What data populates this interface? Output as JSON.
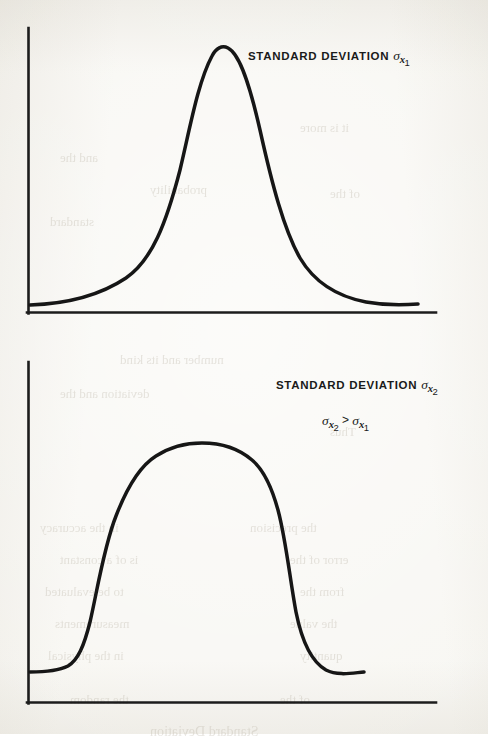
{
  "document": {
    "kind": "scanned-textbook-figure-page",
    "background_color": "#f8f7f3",
    "ink_color": "#161616"
  },
  "figures": [
    {
      "id": "figure-top",
      "label_main_prefix": "STANDARD DEVIATION ",
      "label_sigma": "σ",
      "label_subscript_var": "x",
      "label_subscript_index": "1"
    },
    {
      "id": "figure-bottom",
      "label_main_prefix": "STANDARD DEVIATION ",
      "label_sigma": "σ",
      "label_subscript_var": "x",
      "label_subscript_index": "2",
      "inequality": {
        "left_sigma": "σ",
        "left_var": "x",
        "left_index": "2",
        "operator": ">",
        "right_sigma": "σ",
        "right_var": "x",
        "right_index": "1"
      }
    }
  ],
  "bleed_through": [
    {
      "text": "it is more",
      "x": 300,
      "y": 120,
      "size": 13
    },
    {
      "text": "and the",
      "x": 60,
      "y": 150,
      "size": 13
    },
    {
      "text": "probability",
      "x": 150,
      "y": 182,
      "size": 13
    },
    {
      "text": "of the",
      "x": 330,
      "y": 186,
      "size": 13
    },
    {
      "text": "standard",
      "x": 50,
      "y": 214,
      "size": 13
    },
    {
      "text": "number and its kind",
      "x": 120,
      "y": 352,
      "size": 13
    },
    {
      "text": "deviation and the",
      "x": 60,
      "y": 386,
      "size": 13
    },
    {
      "text": "Thus",
      "x": 330,
      "y": 424,
      "size": 13
    },
    {
      "text": "in the accuracy",
      "x": 40,
      "y": 520,
      "size": 13
    },
    {
      "text": "the precision",
      "x": 250,
      "y": 520,
      "size": 13
    },
    {
      "text": "is of a constant",
      "x": 60,
      "y": 552,
      "size": 13
    },
    {
      "text": "error of the",
      "x": 290,
      "y": 552,
      "size": 13
    },
    {
      "text": "to be evaluated",
      "x": 45,
      "y": 584,
      "size": 13
    },
    {
      "text": "from the",
      "x": 300,
      "y": 584,
      "size": 13
    },
    {
      "text": "measurements",
      "x": 55,
      "y": 616,
      "size": 13
    },
    {
      "text": "the value",
      "x": 290,
      "y": 616,
      "size": 13
    },
    {
      "text": "in the physical",
      "x": 48,
      "y": 648,
      "size": 13
    },
    {
      "text": "quantity",
      "x": 300,
      "y": 648,
      "size": 13
    },
    {
      "text": "the random",
      "x": 70,
      "y": 692,
      "size": 13
    },
    {
      "text": "of the",
      "x": 280,
      "y": 692,
      "size": 13
    },
    {
      "text": "Standard Deviation",
      "x": 150,
      "y": 724,
      "size": 14
    }
  ],
  "chart_data": [
    {
      "type": "line",
      "id": "gaussian-narrow",
      "title": "STANDARD DEVIATION σx1",
      "description": "Normal (Gaussian) probability density curve with a small standard deviation — tall, narrow, sharply peaked with long flat tails.",
      "xlabel": "",
      "ylabel": "",
      "grid": false,
      "legend": false,
      "axes": {
        "x_axis": true,
        "y_axis": true,
        "ticks": false,
        "tick_labels": false
      },
      "x": [
        0,
        5,
        10,
        15,
        20,
        25,
        30,
        35,
        40,
        45,
        50,
        55,
        60,
        65,
        70,
        75,
        80,
        85,
        90,
        95,
        100
      ],
      "y": [
        0.01,
        0.015,
        0.02,
        0.03,
        0.05,
        0.08,
        0.14,
        0.24,
        0.4,
        0.62,
        0.84,
        0.98,
        1.0,
        0.92,
        0.74,
        0.52,
        0.34,
        0.21,
        0.12,
        0.06,
        0.02
      ],
      "peak_x": 60,
      "peak_y": 1.0
    },
    {
      "type": "line",
      "id": "gaussian-wide-plateau",
      "title": "STANDARD DEVIATION σx2",
      "annotation": "σx2 > σx1",
      "description": "Broad, flat-topped (plateau / super-Gaussian) distribution curve with a large standard deviation — wide top and steep shoulders.",
      "xlabel": "",
      "ylabel": "",
      "grid": false,
      "legend": false,
      "axes": {
        "x_axis": true,
        "y_axis": true,
        "ticks": false,
        "tick_labels": false
      },
      "x": [
        0,
        5,
        10,
        15,
        20,
        25,
        30,
        35,
        40,
        45,
        50,
        55,
        60,
        65,
        70,
        75,
        80,
        85,
        90,
        95,
        100
      ],
      "y": [
        0.02,
        0.02,
        0.03,
        0.06,
        0.16,
        0.42,
        0.72,
        0.9,
        0.97,
        1.0,
        1.0,
        1.0,
        0.99,
        0.96,
        0.9,
        0.76,
        0.5,
        0.24,
        0.09,
        0.04,
        0.03
      ],
      "plateau_start_x": 40,
      "plateau_end_x": 62,
      "peak_y": 1.0
    }
  ]
}
